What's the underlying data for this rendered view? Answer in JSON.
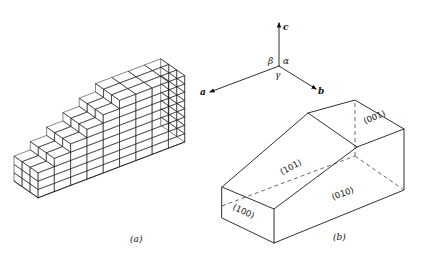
{
  "figure": {
    "panel_a": {
      "caption": "(a)",
      "description": "stepped stack of unit-cell bricks forming a staircase",
      "steps": 6,
      "cells_deep": 3,
      "cells_wide_top": 4
    },
    "panel_b": {
      "caption": "(b)",
      "faces": [
        "(001)",
        "(101)",
        "(010)",
        "(100)"
      ]
    },
    "axes": {
      "labels": {
        "a": "a",
        "b": "b",
        "c": "c"
      },
      "angles": {
        "alpha": "α",
        "beta": "β",
        "gamma": "γ"
      }
    }
  }
}
